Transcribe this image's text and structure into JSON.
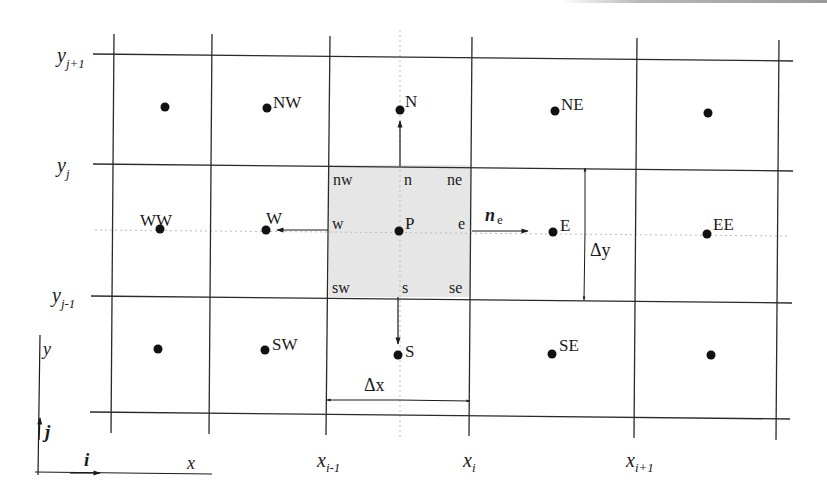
{
  "diagram": {
    "title": "",
    "type": "finite-volume 2D structured grid stencil",
    "colors": {
      "line": "#2a2a2a",
      "shaded_cell": "#e6e6e6",
      "point": "#111111",
      "dotted": "#bdbdbd"
    },
    "row_labels": {
      "y_j_plus_1": {
        "base": "y",
        "sub": "j+1"
      },
      "y_j": {
        "base": "y",
        "sub": "j"
      },
      "y_j_minus_1": {
        "base": "y",
        "sub": "j-1"
      }
    },
    "column_labels": {
      "x_i_minus_1": {
        "base": "x",
        "sub": "i-1"
      },
      "x_i": {
        "base": "x",
        "sub": "i"
      },
      "x_i_plus_1": {
        "base": "x",
        "sub": "i+1"
      }
    },
    "nodes": {
      "NW": "NW",
      "N": "N",
      "NE": "NE",
      "WW": "WW",
      "W": "W",
      "P": "P",
      "E": "E",
      "EE": "EE",
      "SW": "SW",
      "S": "S",
      "SE": "SE"
    },
    "faces": {
      "nw": "nw",
      "n": "n",
      "ne": "ne",
      "w": "w",
      "e": "e",
      "sw": "sw",
      "s": "s",
      "se": "se"
    },
    "normal": {
      "base": "n",
      "sub": "e"
    },
    "spacing": {
      "dx": "Δx",
      "dy": "Δy"
    },
    "axes": {
      "x_label": "x",
      "y_label": "y",
      "i_label": "i",
      "j_label": "j"
    }
  }
}
